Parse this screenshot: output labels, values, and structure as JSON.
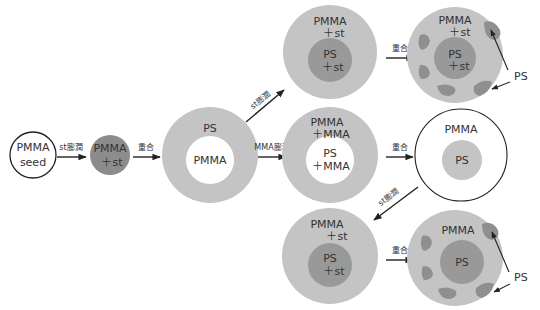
{
  "colors": {
    "dark_particle": "#8c8c8c",
    "light_shell": "#c4c4c4",
    "inner_core": "#999999",
    "patch": "#8f8f8f",
    "line": "#222222",
    "text": "#333333"
  },
  "stages": {
    "seed": {
      "line1": "PMMA",
      "line2": "seed"
    },
    "swollen_seed": {
      "line1": "PMMA",
      "line2": "＋st"
    },
    "core_shell": {
      "outer": "PS",
      "inner": "PMMA"
    },
    "top_swollen": {
      "outer1": "PMMA",
      "outer2": "＋st",
      "inner1": "PS",
      "inner2": "＋st"
    },
    "top_result": {
      "outer1": "PMMA",
      "outer2": "＋st",
      "inner1": "PS",
      "inner2": "＋st",
      "callout": "PS"
    },
    "mid_swollen": {
      "outer1": "PMMA",
      "outer2": "＋MMA",
      "inner1": "PS",
      "inner2": "＋MMA"
    },
    "mid_result": {
      "outer": "PMMA",
      "inner": "PS"
    },
    "bot_swollen": {
      "outer1": "PMMA",
      "outer2": "＋st",
      "inner1": "PS",
      "inner2": "＋st"
    },
    "bot_result": {
      "outer": "PMMA",
      "inner": "PS",
      "callout": "PS"
    }
  },
  "arrows": {
    "seed_to_swollen": "st膨潤",
    "swollen_to_coreshell": "重合",
    "coreshell_to_top": "st膨潤",
    "coreshell_to_mid": "MMA膨潤",
    "top_polymerize": "重合",
    "mid_polymerize": "重合",
    "mid_to_bot": "st膨潤",
    "bot_polymerize": "重合"
  }
}
